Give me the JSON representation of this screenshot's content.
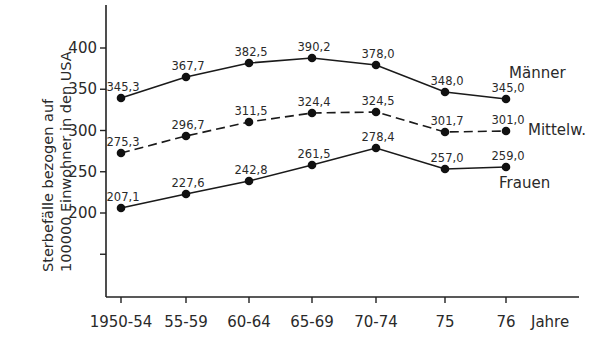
{
  "chart_data": {
    "type": "line",
    "title": "",
    "xlabel": "Jahre",
    "ylabel": "Sterbefälle bezogen auf 100000 Einwohner in den USA",
    "ylabel_lines": [
      "Sterbefälle bezogen auf",
      "100000 Einwohner in den USA"
    ],
    "categories": [
      "1950-54",
      "55-59",
      "60-64",
      "65-69",
      "70-74",
      "75",
      "76"
    ],
    "yticks": [
      150,
      200,
      250,
      300,
      350,
      400
    ],
    "ytick_labels": [
      "",
      "200",
      "250",
      "300",
      "350",
      "400"
    ],
    "ylim": [
      125,
      460
    ],
    "grid": false,
    "series": [
      {
        "name": "Männer",
        "style": "solid",
        "values": [
          345.3,
          367.7,
          382.5,
          390.2,
          378.0,
          348.0,
          345.0
        ],
        "labels": [
          "345,3",
          "367,7",
          "382,5",
          "390,2",
          "378,0",
          "348,0",
          "345,0"
        ],
        "px_y": [
          98,
          77,
          63,
          58,
          65,
          92,
          99
        ]
      },
      {
        "name": "Mittelw.",
        "style": "dashed",
        "values": [
          275.3,
          296.7,
          311.5,
          324.4,
          324.5,
          301.7,
          301.0
        ],
        "labels": [
          "275,3",
          "296,7",
          "311,5",
          "324,4",
          "324,5",
          "301,7",
          "301,0"
        ],
        "px_y": [
          153,
          136,
          122,
          113,
          112,
          132,
          131
        ]
      },
      {
        "name": "Frauen",
        "style": "solid",
        "values": [
          207.1,
          227.6,
          242.8,
          261.5,
          278.4,
          257.0,
          259.0
        ],
        "labels": [
          "207,1",
          "227,6",
          "242,8",
          "261,5",
          "278,4",
          "257,0",
          "259,0"
        ],
        "px_y": [
          208,
          194,
          181,
          165,
          148,
          169,
          167
        ]
      }
    ],
    "legend": "inline labels at right end of each series",
    "colors": {
      "line": "#1a1a1a",
      "text": "#2a2a2a",
      "background": "#ffffff"
    }
  }
}
